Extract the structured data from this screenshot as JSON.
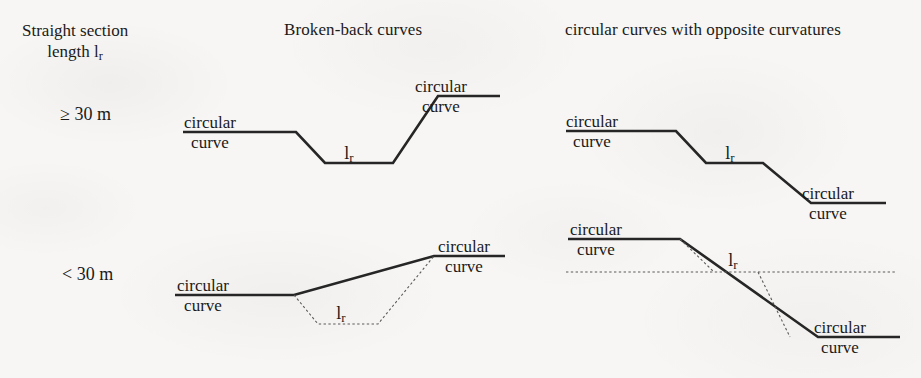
{
  "figure": {
    "corner_label_line1": "Straight section",
    "corner_label_line2_prefix": "length l",
    "corner_label_line2_sub": "r"
  },
  "columns": [
    {
      "id": "broken-back",
      "header": "Broken-back curves"
    },
    {
      "id": "opposite-curvatures",
      "header": "circular curves with opposite curvatures"
    }
  ],
  "rows": [
    {
      "id": "ge-30m",
      "label": "≥ 30 m"
    },
    {
      "id": "lt-30m",
      "label": "< 30 m"
    }
  ],
  "labels": {
    "circular": "circular",
    "curve": "curve",
    "lr_prefix": "l",
    "lr_sub": "r"
  },
  "panels": [
    {
      "id": "broken-back-ge-30m",
      "row": "ge-30m",
      "column": "broken-back",
      "description": "Broken-back curves with straight section length greater than or equal to 30 m",
      "solid_polyline": "183,132 296,132 325,163 393,163 438,96 500,96",
      "dotted_paths": [],
      "curve_labels": [
        {
          "circular_x": 210,
          "circular_y": 113,
          "curve_x": 210,
          "curve_y": 133
        },
        {
          "circular_x": 441,
          "circular_y": 77,
          "curve_x": 441,
          "curve_y": 97
        }
      ],
      "lr_labels": [
        {
          "x": 349,
          "y": 143
        }
      ]
    },
    {
      "id": "opposite-ge-30m",
      "row": "ge-30m",
      "column": "opposite-curvatures",
      "description": "Circular curves with opposite curvatures, straight section length greater than or equal to 30 m",
      "solid_polyline": "566,131 676,131 706,163 763,163 811,203 886,203",
      "dotted_paths": [],
      "curve_labels": [
        {
          "circular_x": 592,
          "circular_y": 112,
          "curve_x": 592,
          "curve_y": 132
        },
        {
          "circular_x": 828,
          "circular_y": 184,
          "curve_x": 828,
          "curve_y": 204
        }
      ],
      "lr_labels": [
        {
          "x": 730,
          "y": 143
        }
      ]
    },
    {
      "id": "broken-back-lt-30m",
      "row": "lt-30m",
      "column": "broken-back",
      "description": "Broken-back curves with straight section length less than 30 m",
      "solid_polyline": "175,295 294,295 434,256 505,256",
      "dotted_paths": [
        "M294,295 L318,324 L378,324 L434,256"
      ],
      "curve_labels": [
        {
          "circular_x": 203,
          "circular_y": 276,
          "curve_x": 203,
          "curve_y": 296
        },
        {
          "circular_x": 464,
          "circular_y": 237,
          "curve_x": 464,
          "curve_y": 257
        }
      ],
      "lr_labels": [
        {
          "x": 341,
          "y": 303
        }
      ]
    },
    {
      "id": "opposite-lt-30m",
      "row": "lt-30m",
      "column": "opposite-curvatures",
      "description": "Circular curves with opposite curvatures, straight section length less than 30 m",
      "solid_polyline": "568,239 680,239 818,337 900,337",
      "dotted_paths": [
        "M566,272 L895,272",
        "M680,239 L714,272",
        "M758,272 L790,337"
      ],
      "curve_labels": [
        {
          "circular_x": 596,
          "circular_y": 220,
          "curve_x": 596,
          "curve_y": 240
        },
        {
          "circular_x": 840,
          "circular_y": 318,
          "curve_x": 840,
          "curve_y": 338
        }
      ],
      "lr_labels": [
        {
          "x": 733,
          "y": 250
        }
      ]
    }
  ],
  "header_positions": [
    {
      "x": 284,
      "y": 20
    },
    {
      "x": 565,
      "y": 20
    }
  ],
  "corner_position": {
    "x": 22,
    "y": 20
  },
  "row_label_positions": [
    {
      "x": 60,
      "y": 104
    },
    {
      "x": 62,
      "y": 264
    }
  ],
  "style": {
    "ink": "#262626",
    "dotted_ink": "#5a5a5a",
    "paper": "#f7f6f4"
  }
}
